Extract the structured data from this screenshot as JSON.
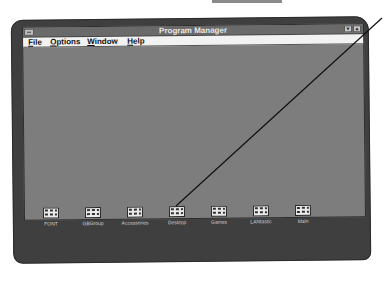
{
  "window": {
    "title": "Program Manager",
    "controls": {
      "minimize": "▼",
      "maximize": "▲"
    }
  },
  "menubar": {
    "items": [
      {
        "label": "File",
        "accel": "F",
        "rest": "ile"
      },
      {
        "label": "Options",
        "accel": "O",
        "rest": "ptions"
      },
      {
        "label": "Window",
        "accel": "W",
        "rest": "indow"
      },
      {
        "label": "Help",
        "accel": "H",
        "rest": "elp"
      }
    ]
  },
  "program_groups": [
    {
      "label": "FONT"
    },
    {
      "label": "GBGroup"
    },
    {
      "label": "Accessories"
    },
    {
      "label": "Desktop"
    },
    {
      "label": "Games"
    },
    {
      "label": "LANtastic"
    },
    {
      "label": "Main"
    }
  ],
  "callout": {
    "target": "Desktop"
  }
}
